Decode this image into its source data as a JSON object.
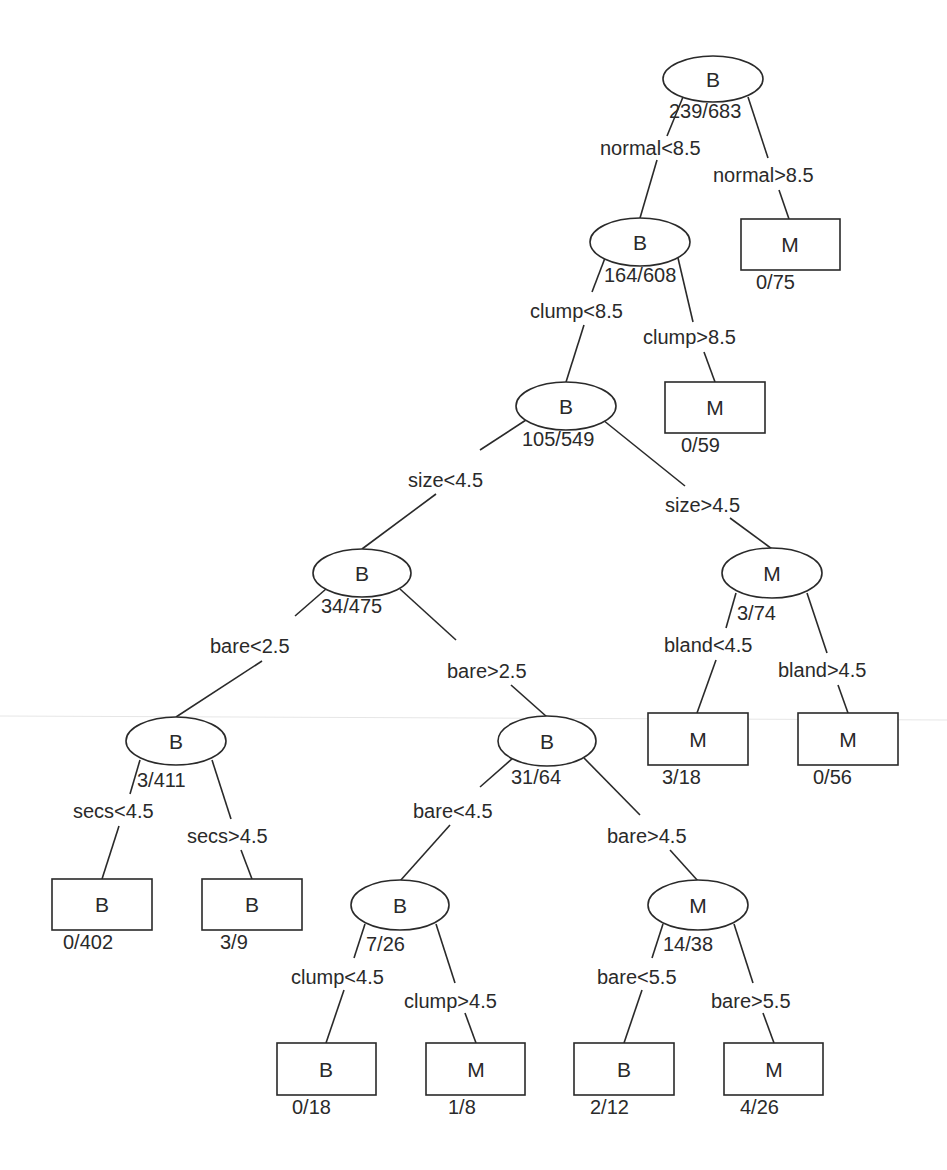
{
  "diagram": {
    "type": "decision-tree",
    "node_legend": {
      "ellipse": "internal node",
      "rectangle": "leaf node"
    },
    "classes": {
      "B": "B",
      "M": "M"
    },
    "nodes": [
      {
        "id": "n0",
        "shape": "ellipse",
        "class": "B",
        "count": "239/683",
        "cx": 713,
        "cy": 79
      },
      {
        "id": "n1",
        "shape": "ellipse",
        "class": "B",
        "count": "164/608",
        "cx": 640,
        "cy": 242
      },
      {
        "id": "n2",
        "shape": "rect",
        "class": "M",
        "count": "0/75",
        "cx": 790,
        "cy": 244
      },
      {
        "id": "n3",
        "shape": "ellipse",
        "class": "B",
        "count": "105/549",
        "cx": 566,
        "cy": 406
      },
      {
        "id": "n4",
        "shape": "rect",
        "class": "M",
        "count": "0/59",
        "cx": 715,
        "cy": 407
      },
      {
        "id": "n5",
        "shape": "ellipse",
        "class": "B",
        "count": "34/475",
        "cx": 362,
        "cy": 573
      },
      {
        "id": "n6",
        "shape": "ellipse",
        "class": "M",
        "count": "3/74",
        "cx": 772,
        "cy": 573
      },
      {
        "id": "n7",
        "shape": "ellipse",
        "class": "B",
        "count": "3/411",
        "cx": 176,
        "cy": 741
      },
      {
        "id": "n8",
        "shape": "ellipse",
        "class": "B",
        "count": "31/64",
        "cx": 547,
        "cy": 741
      },
      {
        "id": "n9",
        "shape": "rect",
        "class": "M",
        "count": "3/18",
        "cx": 697,
        "cy": 739
      },
      {
        "id": "n10",
        "shape": "rect",
        "class": "M",
        "count": "0/56",
        "cx": 848,
        "cy": 739
      },
      {
        "id": "n11",
        "shape": "rect",
        "class": "B",
        "count": "0/402",
        "cx": 102,
        "cy": 904
      },
      {
        "id": "n12",
        "shape": "rect",
        "class": "B",
        "count": "3/9",
        "cx": 252,
        "cy": 904
      },
      {
        "id": "n13",
        "shape": "ellipse",
        "class": "B",
        "count": "7/26",
        "cx": 400,
        "cy": 905
      },
      {
        "id": "n14",
        "shape": "ellipse",
        "class": "M",
        "count": "14/38",
        "cx": 698,
        "cy": 905
      },
      {
        "id": "n15",
        "shape": "rect",
        "class": "B",
        "count": "0/18",
        "cx": 326,
        "cy": 1069
      },
      {
        "id": "n16",
        "shape": "rect",
        "class": "M",
        "count": "1/8",
        "cx": 476,
        "cy": 1069
      },
      {
        "id": "n17",
        "shape": "rect",
        "class": "B",
        "count": "2/12",
        "cx": 624,
        "cy": 1069
      },
      {
        "id": "n18",
        "shape": "rect",
        "class": "M",
        "count": "4/26",
        "cx": 774,
        "cy": 1069
      }
    ],
    "edges": [
      {
        "from": "n0",
        "to": "n1",
        "label": "normal<8.5"
      },
      {
        "from": "n0",
        "to": "n2",
        "label": "normal>8.5"
      },
      {
        "from": "n1",
        "to": "n3",
        "label": "clump<8.5"
      },
      {
        "from": "n1",
        "to": "n4",
        "label": "clump>8.5"
      },
      {
        "from": "n3",
        "to": "n5",
        "label": "size<4.5"
      },
      {
        "from": "n3",
        "to": "n6",
        "label": "size>4.5"
      },
      {
        "from": "n5",
        "to": "n7",
        "label": "bare<2.5"
      },
      {
        "from": "n5",
        "to": "n8",
        "label": "bare>2.5"
      },
      {
        "from": "n6",
        "to": "n9",
        "label": "bland<4.5"
      },
      {
        "from": "n6",
        "to": "n10",
        "label": "bland>4.5"
      },
      {
        "from": "n7",
        "to": "n11",
        "label": "secs<4.5"
      },
      {
        "from": "n7",
        "to": "n12",
        "label": "secs>4.5"
      },
      {
        "from": "n8",
        "to": "n13",
        "label": "bare<4.5"
      },
      {
        "from": "n8",
        "to": "n14",
        "label": "bare>4.5"
      },
      {
        "from": "n13",
        "to": "n15",
        "label": "clump<4.5"
      },
      {
        "from": "n13",
        "to": "n16",
        "label": "clump>4.5"
      },
      {
        "from": "n14",
        "to": "n17",
        "label": "bare<5.5"
      },
      {
        "from": "n14",
        "to": "n18",
        "label": "bare>5.5"
      }
    ]
  },
  "colors": {
    "ink": "#2a2a2a",
    "paper": "#ffffff"
  }
}
